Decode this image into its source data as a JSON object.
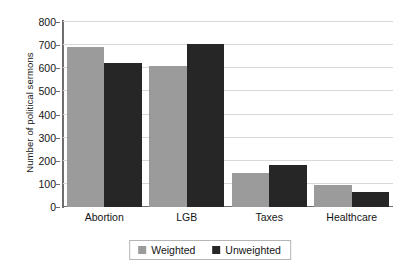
{
  "chart_data": {
    "type": "bar",
    "title": "",
    "subtitle": "",
    "xlabel": "",
    "ylabel": "Number of political sermons",
    "categories": [
      "Abortion",
      "LGB",
      "Taxes",
      "Healthcare"
    ],
    "series": [
      {
        "name": "Weighted",
        "color": "#9b9b9b",
        "values": [
          692,
          610,
          148,
          97
        ]
      },
      {
        "name": "Unweighted",
        "color": "#262626",
        "values": [
          622,
          705,
          180,
          65
        ]
      }
    ],
    "ylim": [
      0,
      800
    ],
    "ytick_labels": [
      "0",
      "100",
      "200",
      "300",
      "400",
      "500",
      "600",
      "700",
      "800"
    ],
    "ytick_values": [
      0,
      100,
      200,
      300,
      400,
      500,
      600,
      700,
      800
    ],
    "grid": "horizontal",
    "legend_position": "bottom-center",
    "background_color": "#ffffff",
    "axis_color": "#6e6e6e",
    "gridline_color": "#d8d8d8"
  }
}
